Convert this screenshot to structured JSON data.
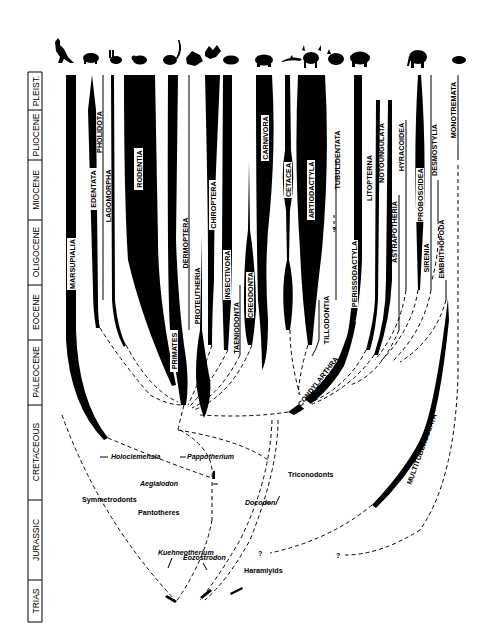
{
  "figure": {
    "type": "phylogenetic-tree"
  },
  "time_scale": [
    {
      "label": "PLEIST.",
      "y0": 72,
      "y1": 110
    },
    {
      "label": "PLIOCENE",
      "y0": 110,
      "y1": 160
    },
    {
      "label": "MIOCENE",
      "y0": 160,
      "y1": 220
    },
    {
      "label": "OLIGOCENE",
      "y0": 220,
      "y1": 285
    },
    {
      "label": "EOCENE",
      "y0": 285,
      "y1": 340
    },
    {
      "label": "PALEOCENE",
      "y0": 340,
      "y1": 405
    },
    {
      "label": "CRETACEOUS",
      "y0": 405,
      "y1": 500
    },
    {
      "label": "JURASSIC",
      "y0": 500,
      "y1": 580
    },
    {
      "label": "TRIAS",
      "y0": 580,
      "y1": 622
    }
  ],
  "orders": {
    "marsupialia": "MARSUPIALIA",
    "edentata": "EDENTATA",
    "pholidota": "PHOLIDOTA",
    "lagomorpha": "LAGOMORPHA",
    "rodentia": "RODENTIA",
    "primates": "PRIMATES",
    "dermoptera": "DERMOPTERA",
    "proteutheria": "PROTEUTHERIA",
    "chiroptera": "CHIROPTERA",
    "insectivora": "INSECTIVORA",
    "taeniodonta": "TAENIODONTA",
    "creodonta": "CREODONTA",
    "carnivora": "CARNIVORA",
    "cetacea": "CETACEA",
    "artiodactyla": "ARTIODACTYLA",
    "tillodontia": "TILLODONTIA",
    "tubulidentata": "TUBULIDENTATA",
    "condylarthra": "CONDYLARTHRA",
    "perissodactyla": "PERISSODACTYLA",
    "litopterna": "LITOPTERNA",
    "notoungulata": "NOTOUNGULATA",
    "astrapotheria": "ASTRAPOTHERIA",
    "hyracoidea": "HYRACOIDEA",
    "proboscidea": "PROBOSCIDEA",
    "sirenia": "SIRENIA",
    "desmostylia": "DESMOSTYLIA",
    "embrithopoda": "EMBRITHOPODA",
    "monotremata": "MONOTREMATA",
    "multituberculata": "MULTITUBERCULATA"
  },
  "taxa": {
    "holoclemensia": "Holoclemensia",
    "pappotherium": "Pappotherium",
    "aegialodon": "Aegialodon",
    "symmetrodonts": "Symmetrodonts",
    "pantotheres": "Pantotheres",
    "triconodonts": "Triconodonts",
    "docodon": "Docodon",
    "kuehneotherium": "Kuehneotherium",
    "eozostrodon": "Eozostrodon",
    "haramiyids": "Haramiyids"
  },
  "markers": {
    "uncertain": "?"
  },
  "silhouettes": [
    "kangaroo-icon",
    "armadillo-icon",
    "rabbit-icon",
    "rodent-icon",
    "lemur-icon",
    "colugo-icon",
    "bat-icon",
    "shrew-icon",
    "bear-icon",
    "dolphin-icon",
    "antelope-icon",
    "aardvark-icon",
    "rhinoceros-icon",
    "elephant-icon",
    "platypus-icon"
  ]
}
